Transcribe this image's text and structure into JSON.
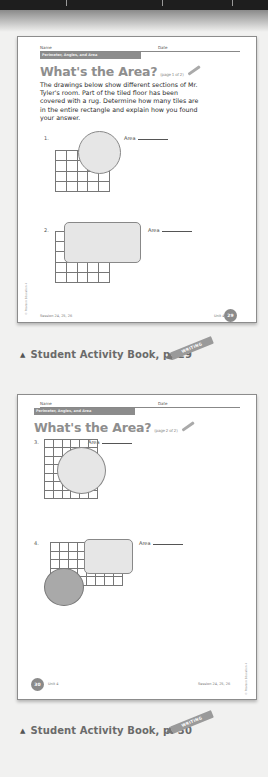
{
  "page1": {
    "name_label": "Name",
    "date_label": "Date",
    "band_label": "Perimeter, Angles, and Area",
    "title": "What's the Area?",
    "title_sub": "(page 1 of 2)",
    "intro": "The drawings below show different sections of Mr. Tyler's room. Part of the tiled floor has been covered with a rug. Determine how many tiles are in the entire rectangle and explain how you found your answer.",
    "questions": [
      {
        "number": "1.",
        "area_label": "Area"
      },
      {
        "number": "2.",
        "area_label": "Area"
      }
    ],
    "footer_left": "Session 24, 25, 26",
    "footer_unit": "Unit 4",
    "page_number": "29",
    "copyright": "© Pearson Education 4"
  },
  "caption1": {
    "icon": "triangle-up-icon",
    "text": "Student Activity Book, p. 29",
    "badge": "WRITING"
  },
  "page2": {
    "name_label": "Name",
    "date_label": "Date",
    "band_label": "Perimeter, Angles, and Area",
    "title": "What's the Area?",
    "title_sub": "(page 2 of 2)",
    "questions": [
      {
        "number": "3.",
        "area_label": "Area"
      },
      {
        "number": "4.",
        "area_label": "Area"
      }
    ],
    "footer_right": "Session 24, 25, 26",
    "footer_unit": "Unit 4",
    "page_number": "30",
    "copyright": "© Pearson Education 4"
  },
  "caption2": {
    "icon": "triangle-up-icon",
    "text": "Student Activity Book, p. 30",
    "badge": "WRITING"
  },
  "colors": {
    "background": "#f1f1f0",
    "band": "#8c8c8c",
    "title": "#8e8e8e",
    "badge": "#8a8a8a"
  }
}
